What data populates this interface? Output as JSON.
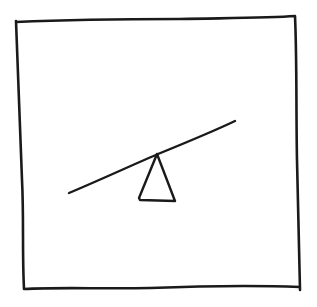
{
  "diagram": {
    "style": "hand-drawn sketch",
    "colors": {
      "ink": "#1a1a1a",
      "background": "#ffffff"
    },
    "frame": {
      "label": "frame",
      "points": [
        [
          16,
          22
        ],
        [
          95,
          19
        ],
        [
          200,
          18
        ],
        [
          295,
          17
        ],
        [
          297,
          90
        ],
        [
          297,
          180
        ],
        [
          300,
          289
        ],
        [
          200,
          287
        ],
        [
          100,
          289
        ],
        [
          24,
          287
        ],
        [
          22,
          200
        ],
        [
          17,
          100
        ]
      ]
    },
    "plank": {
      "label": "seesaw plank",
      "start": [
        69,
        193
      ],
      "end": [
        235,
        121
      ]
    },
    "fulcrum": {
      "label": "triangular fulcrum",
      "apex": [
        157,
        154
      ],
      "base_left": [
        139,
        199
      ],
      "base_right": [
        175,
        200
      ]
    }
  }
}
